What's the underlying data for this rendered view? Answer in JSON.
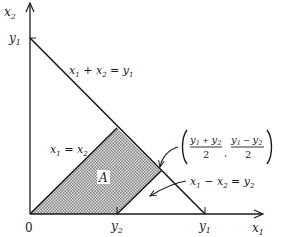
{
  "diagram": {
    "axes": {
      "x_axis_label": "x",
      "x_axis_sub": "1",
      "y_axis_label": "x",
      "y_axis_sub": "2",
      "origin_label": "0"
    },
    "ticks": {
      "y1_on_vertical": {
        "var": "y",
        "sub": "1"
      },
      "y1_on_horizontal": {
        "var": "y",
        "sub": "1"
      },
      "y2_on_horizontal": {
        "var": "y",
        "sub": "2"
      }
    },
    "lines": {
      "sum_line": {
        "lhs1": "x",
        "sub1": "1",
        "op": " + ",
        "lhs2": "x",
        "sub2": "2",
        "eq": " = ",
        "rhs": "y",
        "rsub": "1"
      },
      "diagonal": {
        "lhs1": "x",
        "sub1": "1",
        "eq": " = ",
        "rhs": "x",
        "rsub": "2"
      },
      "diff_line": {
        "lhs1": "x",
        "sub1": "1",
        "op": " − ",
        "lhs2": "x",
        "sub2": "2",
        "eq": " = ",
        "rhs": "y",
        "rsub": "2"
      }
    },
    "point": {
      "num1_a": "y",
      "num1_a_sub": "1",
      "num1_op": " + ",
      "num1_b": "y",
      "num1_b_sub": "2",
      "den1": "2",
      "num2_a": "y",
      "num2_a_sub": "1",
      "num2_op": " − ",
      "num2_b": "y",
      "num2_b_sub": "2",
      "den2": "2",
      "comma": ","
    },
    "region": {
      "label": "A",
      "fill_color": "#b8b8b8"
    },
    "colors": {
      "line": "#1a1a1a",
      "background": "#ffffff"
    }
  }
}
